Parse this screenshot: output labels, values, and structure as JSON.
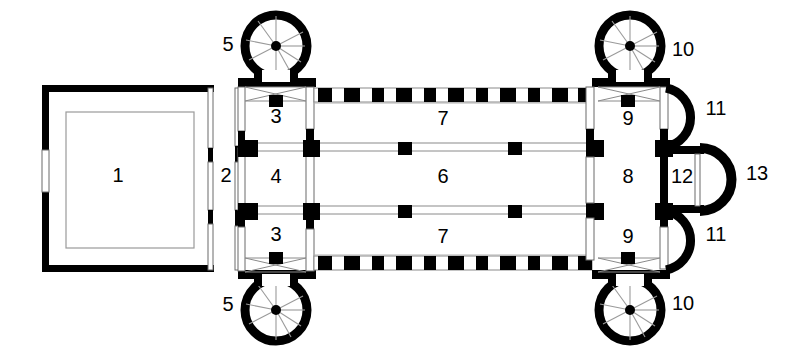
{
  "diagram": {
    "type": "architectural-floor-plan",
    "canvas": {
      "width": 803,
      "height": 352
    },
    "colors": {
      "wall": "#000000",
      "background": "#ffffff",
      "thin_line": "#8a8a8a",
      "label_text": "#000000"
    },
    "labels": [
      {
        "key": "1",
        "text": "1",
        "x": 118,
        "y": 177,
        "name": "atrium"
      },
      {
        "key": "2",
        "text": "2",
        "x": 226,
        "y": 177,
        "name": "narthex"
      },
      {
        "key": "3t",
        "text": "3",
        "x": 276,
        "y": 118,
        "name": "west-tower-bay-north"
      },
      {
        "key": "3b",
        "text": "3",
        "x": 276,
        "y": 236,
        "name": "west-tower-bay-south"
      },
      {
        "key": "4",
        "text": "4",
        "x": 276,
        "y": 178,
        "name": "west-vestibule"
      },
      {
        "key": "5t",
        "text": "5",
        "x": 228,
        "y": 46,
        "name": "west-stair-tower-north"
      },
      {
        "key": "5b",
        "text": "5",
        "x": 228,
        "y": 306,
        "name": "west-stair-tower-south"
      },
      {
        "key": "6",
        "text": "6",
        "x": 443,
        "y": 178,
        "name": "nave"
      },
      {
        "key": "7t",
        "text": "7",
        "x": 443,
        "y": 120,
        "name": "north-aisle"
      },
      {
        "key": "7b",
        "text": "7",
        "x": 443,
        "y": 238,
        "name": "south-aisle"
      },
      {
        "key": "8",
        "text": "8",
        "x": 628,
        "y": 178,
        "name": "choir-crossing"
      },
      {
        "key": "9t",
        "text": "9",
        "x": 628,
        "y": 120,
        "name": "east-tower-bay-north"
      },
      {
        "key": "9b",
        "text": "9",
        "x": 628,
        "y": 238,
        "name": "east-tower-bay-south"
      },
      {
        "key": "10t",
        "text": "10",
        "x": 683,
        "y": 51,
        "name": "east-stair-tower-north"
      },
      {
        "key": "10b",
        "text": "10",
        "x": 683,
        "y": 305,
        "name": "east-stair-tower-south"
      },
      {
        "key": "11t",
        "text": "11",
        "x": 716,
        "y": 110,
        "name": "side-apse-north"
      },
      {
        "key": "11b",
        "text": "11",
        "x": 716,
        "y": 236,
        "name": "side-apse-south"
      },
      {
        "key": "12",
        "text": "12",
        "x": 682,
        "y": 178,
        "name": "presbytery-bay"
      },
      {
        "key": "13",
        "text": "13",
        "x": 757,
        "y": 175,
        "name": "main-apse"
      }
    ],
    "geometry": {
      "atrium": {
        "x": 42,
        "y": 88,
        "w": 168,
        "h": 182,
        "wall": 8,
        "inner": {
          "x": 66,
          "y": 112,
          "w": 128,
          "h": 136
        },
        "west_door": {
          "x": 38,
          "y": 150,
          "w": 9,
          "h": 42
        }
      },
      "narthex": {
        "x": 210,
        "y": 88,
        "w": 30,
        "h": 182
      },
      "west_block": {
        "x": 238,
        "y": 85,
        "w": 76,
        "h": 188
      },
      "nave_block": {
        "x": 314,
        "y": 85,
        "w": 278,
        "h": 188
      },
      "east_block": {
        "x": 592,
        "y": 85,
        "w": 76,
        "h": 188
      },
      "nave_arcade_y": [
        146,
        212
      ],
      "aisle_outer_y": [
        88,
        270
      ],
      "stair_towers": [
        {
          "cx": 276,
          "cy": 46,
          "r": 32,
          "name": "tower-5-north"
        },
        {
          "cx": 276,
          "cy": 310,
          "r": 32,
          "name": "tower-5-south"
        },
        {
          "cx": 628,
          "cy": 46,
          "r": 32,
          "name": "tower-10-north"
        },
        {
          "cx": 628,
          "cy": 310,
          "r": 32,
          "name": "tower-10-south"
        }
      ],
      "side_apses": [
        {
          "cx": 668,
          "cy": 117,
          "r": 29,
          "name": "apse-11-north"
        },
        {
          "cx": 668,
          "cy": 240,
          "r": 29,
          "name": "apse-11-south"
        }
      ],
      "presbytery": {
        "x": 666,
        "y": 148,
        "w": 34,
        "h": 62
      },
      "main_apse": {
        "cx": 700,
        "cy": 179,
        "r": 33
      }
    },
    "pier_pattern": {
      "description": "alternating black pier blocks along aisle outer walls",
      "block_count_per_wall": 14
    }
  }
}
